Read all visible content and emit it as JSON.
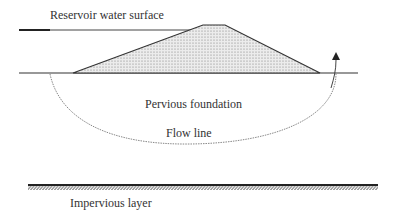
{
  "diagram": {
    "labels": {
      "reservoir": "Reservoir water surface",
      "foundation": "Pervious foundation",
      "flow_line": "Flow line",
      "impervious": "Impervious layer"
    },
    "colors": {
      "line": "#333333",
      "fill": "#e6e6e6",
      "flow": "#888888"
    }
  }
}
